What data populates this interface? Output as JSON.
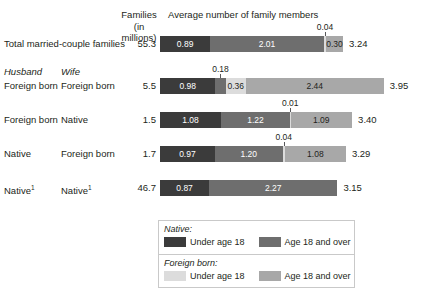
{
  "headers": {
    "families": "Families\n(in millions)",
    "families_line1": "Families",
    "families_line2": "(in millions)",
    "average": "Average number of family members",
    "husband": "Husband",
    "wife": "Wife"
  },
  "legend": {
    "native_title": "Native:",
    "foreign_title": "Foreign born:",
    "under": "Under age 18",
    "over": "Age 18 and over"
  },
  "colors": {
    "native_under18": "#3b3b3b",
    "native_over18": "#6e6e6e",
    "foreign_under18": "#dcdcdc",
    "foreign_over18": "#a8a8a8",
    "text": "#231f20",
    "legend_border": "#c9c9c9",
    "leader": "#58595b"
  },
  "chart_data": {
    "type": "bar",
    "orientation": "horizontal",
    "stacked": true,
    "title": "Average number of family members",
    "xlabel": "Average number of family members",
    "ylabel": "",
    "grid": false,
    "legend_position": "bottom",
    "series": [
      {
        "name": "Native: Under age 18",
        "key": "nat-u",
        "color": "#3b3b3b"
      },
      {
        "name": "Native: Age 18 and over",
        "key": "nat-o",
        "color": "#6e6e6e"
      },
      {
        "name": "Foreign born: Under age 18",
        "key": "for-u",
        "color": "#dcdcdc"
      },
      {
        "name": "Foreign born: Age 18 and over",
        "key": "for-o",
        "color": "#a8a8a8"
      }
    ],
    "columns": [
      "Husband",
      "Wife",
      "Families (in millions)",
      "Average number of family members"
    ],
    "rows": [
      {
        "husband": "Total married-couple families",
        "wife": "",
        "families_millions": "55.3",
        "total": "3.24",
        "segments": [
          {
            "key": "nat-u",
            "value": "0.89",
            "num": 0.89,
            "inside": true
          },
          {
            "key": "nat-o",
            "value": "2.01",
            "num": 2.01,
            "inside": true
          },
          {
            "key": "for-u",
            "value": "0.04",
            "num": 0.04,
            "inside": false
          },
          {
            "key": "for-o",
            "value": "0.30",
            "num": 0.3,
            "inside": true
          }
        ]
      },
      {
        "husband": "Foreign born",
        "wife": "Foreign born",
        "families_millions": "5.5",
        "total": "3.95",
        "segments": [
          {
            "key": "nat-u",
            "value": "0.98",
            "num": 0.98,
            "inside": true
          },
          {
            "key": "nat-o",
            "value": "0.18",
            "num": 0.18,
            "inside": false
          },
          {
            "key": "for-u",
            "value": "0.36",
            "num": 0.36,
            "inside": true
          },
          {
            "key": "for-o",
            "value": "2.44",
            "num": 2.44,
            "inside": true
          }
        ]
      },
      {
        "husband": "Foreign born",
        "wife": "Native",
        "families_millions": "1.5",
        "total": "3.40",
        "segments": [
          {
            "key": "nat-u",
            "value": "1.08",
            "num": 1.08,
            "inside": true
          },
          {
            "key": "nat-o",
            "value": "1.22",
            "num": 1.22,
            "inside": true
          },
          {
            "key": "for-u",
            "value": "0.01",
            "num": 0.01,
            "inside": false
          },
          {
            "key": "for-o",
            "value": "1.09",
            "num": 1.09,
            "inside": true
          }
        ]
      },
      {
        "husband": "Native",
        "wife": "Foreign born",
        "families_millions": "1.7",
        "total": "3.29",
        "segments": [
          {
            "key": "nat-u",
            "value": "0.97",
            "num": 0.97,
            "inside": true
          },
          {
            "key": "nat-o",
            "value": "1.20",
            "num": 1.2,
            "inside": true
          },
          {
            "key": "for-u",
            "value": "0.04",
            "num": 0.04,
            "inside": false
          },
          {
            "key": "for-o",
            "value": "1.08",
            "num": 1.08,
            "inside": true
          }
        ]
      },
      {
        "husband": "Native",
        "husband_sup": "1",
        "wife": "Native",
        "wife_sup": "1",
        "families_millions": "46.7",
        "total": "3.15",
        "segments": [
          {
            "key": "nat-u",
            "value": "0.87",
            "num": 0.87,
            "inside": true
          },
          {
            "key": "nat-o",
            "value": "2.27",
            "num": 2.27,
            "inside": true
          }
        ]
      }
    ]
  }
}
